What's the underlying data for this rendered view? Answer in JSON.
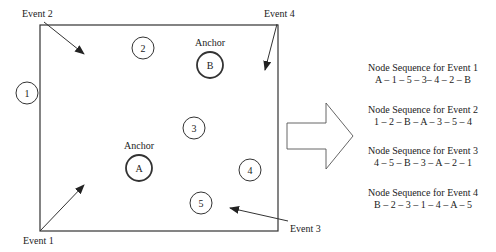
{
  "diagram": {
    "events": [
      {
        "id": "event-1",
        "label": "Event 1"
      },
      {
        "id": "event-2",
        "label": "Event 2"
      },
      {
        "id": "event-3",
        "label": "Event 3"
      },
      {
        "id": "event-4",
        "label": "Event 4"
      }
    ],
    "nodes": [
      {
        "id": "1",
        "label": "1"
      },
      {
        "id": "2",
        "label": "2"
      },
      {
        "id": "3",
        "label": "3"
      },
      {
        "id": "4",
        "label": "4"
      },
      {
        "id": "5",
        "label": "5"
      }
    ],
    "anchors": [
      {
        "id": "A",
        "label": "A",
        "caption": "Anchor"
      },
      {
        "id": "B",
        "label": "B",
        "caption": "Anchor"
      }
    ],
    "sequences": [
      {
        "title": "Node Sequence for Event 1",
        "sequence": "A – 1 – 5 – 3– 4 – 2 – B"
      },
      {
        "title": "Node Sequence for Event 2",
        "sequence": "1 – 2 – B – A – 3 – 5 – 4"
      },
      {
        "title": "Node Sequence for Event 3",
        "sequence": "4 – 5 – B – 3 – A – 2 – 1"
      },
      {
        "title": "Node Sequence for Event 4",
        "sequence": "B – 2 – 3 – 1 – 4 – A – 5"
      }
    ]
  }
}
